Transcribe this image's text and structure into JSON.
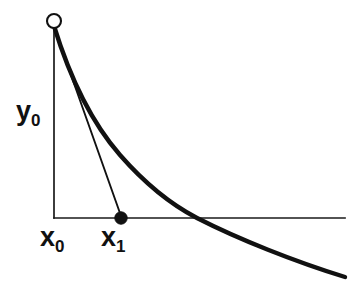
{
  "figure": {
    "type": "math-diagram",
    "background_color": "#ffffff",
    "ink_color": "#111111"
  },
  "labels": {
    "y0": {
      "base": "y",
      "sub": "0",
      "text": "y0"
    },
    "x0": {
      "base": "x",
      "sub": "0",
      "text": "x0"
    },
    "x1": {
      "base": "x",
      "sub": "1",
      "text": "x1"
    }
  },
  "markers": {
    "start_point": {
      "name": "open-circle-marker",
      "style": "open",
      "cx": 54,
      "cy": 21,
      "r": 7.0,
      "fill": "#ffffff",
      "stroke": "#111111"
    },
    "next_point": {
      "name": "filled-dot-marker",
      "style": "filled",
      "cx": 121,
      "cy": 218,
      "r": 6.2,
      "fill": "#111111",
      "stroke": "#111111"
    }
  },
  "geometry": {
    "x_axis": {
      "y": 218,
      "x_start": 54,
      "x_end": 345,
      "stroke_width": 1.7
    },
    "y_axis": {
      "x": 54,
      "y_start": 29,
      "y_end": 218,
      "stroke_width": 1.7
    },
    "curve": {
      "stroke_width": 4.4,
      "path": "M 54 26 C 70 78, 92 123, 120 155 C 148 187, 172 205, 197 218 C 238 239, 296 262, 345 277",
      "x_intercept_x": 197,
      "x_intercept_y": 218,
      "end_x": 345,
      "end_y": 277
    },
    "secant": {
      "stroke_width": 1.9,
      "x1": 54,
      "y1": 27,
      "x2": 121,
      "y2": 216
    }
  },
  "chart_data": {
    "type": "line",
    "xlabel": "",
    "ylabel": "",
    "grid": false,
    "legend": false,
    "annotations": [
      "y0",
      "x0",
      "x1"
    ],
    "series": [
      {
        "name": "function curve",
        "style": "thick-solid",
        "x": [
          54,
          70,
          92,
          120,
          148,
          172,
          197,
          238,
          296,
          345
        ],
        "y": [
          26,
          78,
          123,
          155,
          187,
          205,
          218,
          239,
          262,
          277
        ]
      },
      {
        "name": "tangent line from x0 to x1",
        "style": "thin-solid",
        "x": [
          54,
          121
        ],
        "y": [
          27,
          216
        ]
      }
    ],
    "points": [
      {
        "label": "(x0, y0)",
        "x": 54,
        "y": 21,
        "marker": "open-circle"
      },
      {
        "label": "(x1, 0)",
        "x": 121,
        "y": 218,
        "marker": "filled-dot"
      }
    ]
  }
}
